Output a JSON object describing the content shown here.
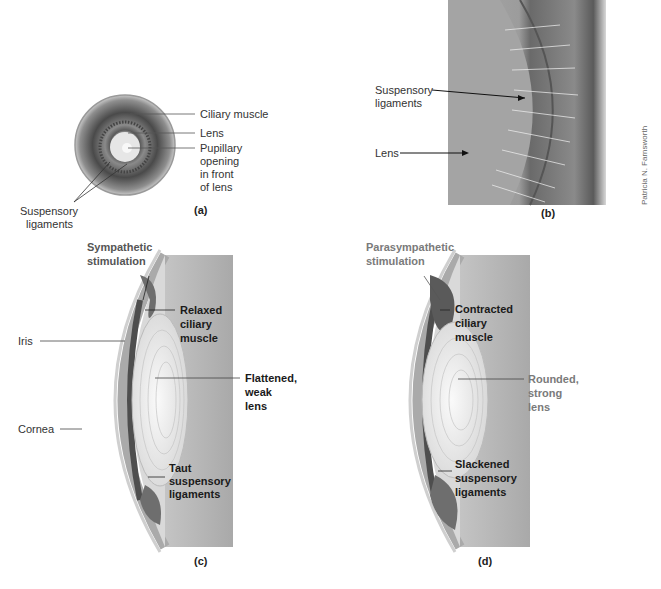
{
  "figure": {
    "panels": {
      "a": {
        "label": "(a)",
        "labels": {
          "ciliary_muscle": "Ciliary muscle",
          "lens": "Lens",
          "pupillary_1": "Pupillary",
          "pupillary_2": "opening",
          "pupillary_3": "in front",
          "pupillary_4": "of lens",
          "suspensory_1": "Suspensory",
          "suspensory_2": "ligaments"
        }
      },
      "b": {
        "label": "(b)",
        "labels": {
          "suspensory_1": "Suspensory",
          "suspensory_2": "ligaments",
          "lens": "Lens"
        },
        "credit": "Patricia N. Farnsworth"
      },
      "c": {
        "label": "(c)",
        "labels": {
          "stimulation_1": "Sympathetic",
          "stimulation_2": "stimulation",
          "muscle_1": "Relaxed",
          "muscle_2": "ciliary",
          "muscle_3": "muscle",
          "iris": "Iris",
          "lens_1": "Flattened,",
          "lens_2": "weak",
          "lens_3": "lens",
          "cornea": "Cornea",
          "ligaments_1": "Taut",
          "ligaments_2": "suspensory",
          "ligaments_3": "ligaments"
        }
      },
      "d": {
        "label": "(d)",
        "labels": {
          "stimulation_1": "Parasympathetic",
          "stimulation_2": "stimulation",
          "muscle_1": "Contracted",
          "muscle_2": "ciliary",
          "muscle_3": "muscle",
          "lens_1": "Rounded,",
          "lens_2": "strong",
          "lens_3": "lens",
          "ligaments_1": "Slackened",
          "ligaments_2": "suspensory",
          "ligaments_3": "ligaments"
        }
      }
    },
    "colors": {
      "background": "#ffffff",
      "tissue_gray": "#b8b8b8",
      "dark_muscle": "#6e6e6e",
      "lens_light": "#efefef",
      "label_dark": "#1a1a1a",
      "label_gray": "#7a7a7a"
    }
  }
}
